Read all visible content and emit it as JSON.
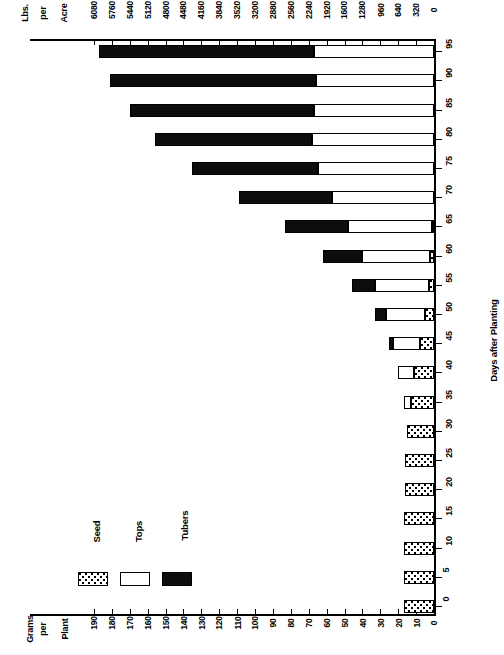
{
  "chart_data": {
    "type": "bar",
    "orientation": "horizontal-stacked",
    "title": "",
    "xlabel": "Days after Planting",
    "ylabel": "Grams per Plant",
    "ylabel_secondary": "Lbs. per Acre",
    "grid": false,
    "legend_position": "bottom-left",
    "categories": [
      0,
      5,
      10,
      15,
      20,
      25,
      30,
      35,
      40,
      45,
      50,
      55,
      60,
      65,
      70,
      75,
      80,
      85,
      90,
      95
    ],
    "series": [
      {
        "name": "Seed",
        "values": [
          17,
          17,
          17,
          17,
          16,
          16,
          15,
          13,
          11,
          8,
          5,
          3,
          2,
          1,
          0,
          0,
          0,
          0,
          0,
          0
        ]
      },
      {
        "name": "Tops",
        "values": [
          0,
          0,
          0,
          0,
          0,
          0,
          0,
          4,
          9,
          15,
          22,
          30,
          38,
          47,
          57,
          65,
          68,
          67,
          66,
          67
        ]
      },
      {
        "name": "Tubers",
        "values": [
          0,
          0,
          0,
          0,
          0,
          0,
          0,
          0,
          0,
          2,
          6,
          13,
          22,
          35,
          52,
          70,
          88,
          103,
          115,
          120
        ]
      }
    ],
    "units_primary": "Grams per Plant",
    "units_secondary": "Lbs. per Acre",
    "conversion_note": "32 lbs per acre per gram per plant",
    "grams_axis": {
      "label": "Grams per Plant",
      "ticks": [
        190,
        180,
        170,
        160,
        150,
        140,
        130,
        120,
        110,
        100,
        90,
        80,
        70,
        60,
        50,
        40,
        30,
        20,
        10,
        0
      ],
      "range": [
        190,
        0
      ],
      "step": 10
    },
    "lbs_axis": {
      "label": "Lbs. per Acre",
      "ticks": [
        6080,
        5760,
        5440,
        5120,
        4800,
        4480,
        4160,
        3840,
        3520,
        3200,
        2880,
        2560,
        2240,
        1920,
        1600,
        1280,
        960,
        640,
        320,
        0
      ],
      "range": [
        6080,
        0
      ],
      "step": 320
    },
    "days_axis": {
      "label": "Days after Planting",
      "ticks": [
        0,
        5,
        10,
        15,
        20,
        25,
        30,
        35,
        40,
        45,
        50,
        55,
        60,
        65,
        70,
        75,
        80,
        85,
        90,
        95
      ],
      "range": [
        0,
        95
      ],
      "step": 5
    }
  },
  "legend": {
    "items": [
      {
        "label": "Seed",
        "pattern": "dotted"
      },
      {
        "label": "Tops",
        "pattern": "white"
      },
      {
        "label": "Tubers",
        "pattern": "black"
      }
    ]
  },
  "titles": {
    "lbs_lines": [
      "Lbs.",
      "per",
      "Acre"
    ],
    "grams_lines": [
      "Grams",
      "per",
      "Plant"
    ],
    "days": "Days after Planting"
  },
  "colors": {
    "tubers": "#0d0d0d",
    "tops": "#ffffff",
    "seed": "#ffffff",
    "axis": "#000000",
    "background": "#ffffff"
  }
}
